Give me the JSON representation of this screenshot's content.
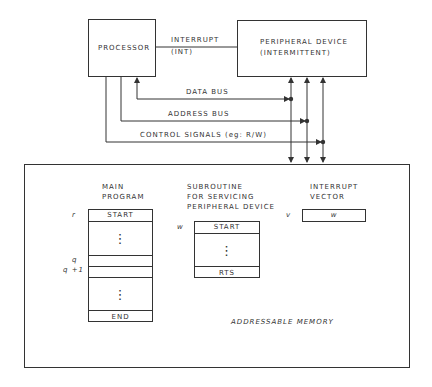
{
  "blocks": {
    "processor": {
      "label": "PROCESSOR"
    },
    "peripheral": {
      "line1": "PERIPHERAL DEVICE",
      "line2": "(INTERMITTENT)"
    },
    "memory": {
      "label": "ADDRESSABLE MEMORY"
    }
  },
  "signals": {
    "interrupt": {
      "line1": "INTERRUPT",
      "line2": "(INT)"
    },
    "data_bus": "DATA BUS",
    "address_bus": "ADDRESS BUS",
    "control": "CONTROL SIGNALS (eg: R/W)"
  },
  "main_program": {
    "title1": "MAIN",
    "title2": "PROGRAM",
    "address_r": "r",
    "address_q": "q",
    "address_q1": "q +1",
    "start": "START",
    "end": "END",
    "ellipsis": "⋮"
  },
  "subroutine": {
    "title1": "SUBROUTINE",
    "title2": "FOR SERVICING",
    "title3": "PERIPHERAL DEVICE",
    "address_w": "w",
    "start": "START",
    "rts": "RTS",
    "ellipsis": "⋮"
  },
  "interrupt_vector": {
    "title1": "INTERRUPT",
    "title2": "VECTOR",
    "address_v": "v",
    "value": "w"
  }
}
